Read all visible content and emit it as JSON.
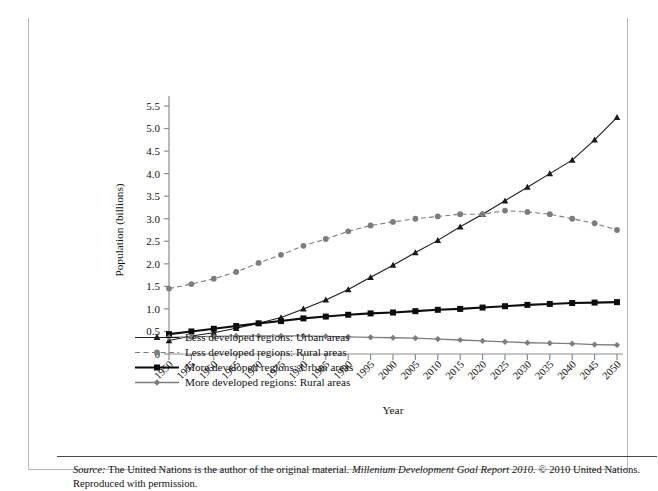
{
  "figure": {
    "label": "FIGURE 7.5",
    "title": "Estimated and Projected Urban and Rural Population of the More and Less Developed Regions, 1950–2050"
  },
  "source": {
    "prefix": "Source:",
    "text_1": " The United Nations is the author of the original material. ",
    "italic_title": "Millenium Development Goal Report 2010.",
    "text_2": " © 2010 United Nations. Reproduced with permission."
  },
  "chart_data": {
    "type": "line",
    "title": "",
    "xlabel": "Year",
    "ylabel": "Population (billions)",
    "xlim": [
      1950,
      2050
    ],
    "ylim": [
      0,
      5.5
    ],
    "ytick_step": 0.5,
    "grid": false,
    "legend_position": "below-axes-left",
    "ytick_labels": [
      "0",
      "0.5",
      "1.0",
      "1.5",
      "2.0",
      "2.5",
      "3.0",
      "3.5",
      "4.0",
      "4.5",
      "5.0",
      "5.5"
    ],
    "ytick_values": [
      0,
      0.5,
      1.0,
      1.5,
      2.0,
      2.5,
      3.0,
      3.5,
      4.0,
      4.5,
      5.0,
      5.5
    ],
    "categories": [
      1950,
      1955,
      1960,
      1965,
      1970,
      1975,
      1980,
      1985,
      1990,
      1995,
      2000,
      2005,
      2010,
      2015,
      2020,
      2025,
      2030,
      2035,
      2040,
      2045,
      2050
    ],
    "series": [
      {
        "name": "Less developed regions: Urban areas",
        "marker": "triangle",
        "color": "#1a1a1a",
        "line_style": "solid",
        "line_width": 1.1,
        "values": [
          0.3,
          0.4,
          0.47,
          0.57,
          0.68,
          0.81,
          1.0,
          1.2,
          1.43,
          1.7,
          1.97,
          2.25,
          2.52,
          2.82,
          3.1,
          3.4,
          3.7,
          4.0,
          4.3,
          4.75,
          5.25
        ]
      },
      {
        "name": "Less developed regions: Rural areas",
        "marker": "circle",
        "color": "#7d7d7d",
        "line_style": "dashed",
        "line_width": 1.1,
        "values": [
          1.45,
          1.55,
          1.67,
          1.82,
          2.02,
          2.2,
          2.4,
          2.55,
          2.72,
          2.85,
          2.93,
          3.0,
          3.05,
          3.1,
          3.1,
          3.18,
          3.15,
          3.1,
          3.0,
          2.9,
          2.75
        ]
      },
      {
        "name": "More developed regions: Urban areas",
        "marker": "square",
        "color": "#0d0d0d",
        "line_style": "solid",
        "line_width": 2.1,
        "values": [
          0.44,
          0.5,
          0.56,
          0.62,
          0.68,
          0.73,
          0.79,
          0.83,
          0.87,
          0.9,
          0.92,
          0.95,
          0.98,
          1.0,
          1.03,
          1.06,
          1.09,
          1.11,
          1.13,
          1.14,
          1.15
        ]
      },
      {
        "name": "More developed regions: Rural areas",
        "marker": "diamond",
        "color": "#7d7d7d",
        "line_style": "solid",
        "line_width": 1.3,
        "values": [
          0.37,
          0.38,
          0.39,
          0.4,
          0.4,
          0.4,
          0.4,
          0.39,
          0.38,
          0.37,
          0.36,
          0.35,
          0.33,
          0.31,
          0.29,
          0.27,
          0.25,
          0.24,
          0.23,
          0.21,
          0.2
        ]
      }
    ]
  }
}
